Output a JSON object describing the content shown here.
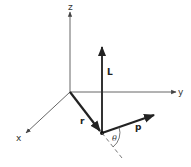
{
  "diagram": {
    "type": "3d-vector-diagram",
    "axes": {
      "x_label": "x",
      "y_label": "y",
      "z_label": "z"
    },
    "vectors": {
      "position_label": "r",
      "momentum_label": "p",
      "angular_momentum_label": "L"
    },
    "angle_label": "θ",
    "colors": {
      "axis": "#555555",
      "vector": "#222222",
      "background": "#ffffff"
    }
  }
}
